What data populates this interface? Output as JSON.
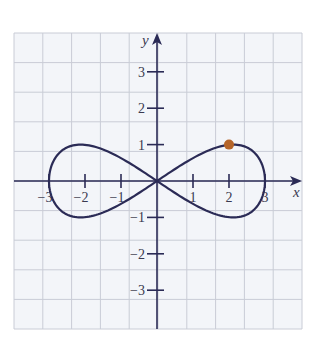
{
  "chart_data": {
    "type": "line",
    "title": "",
    "xlabel": "x",
    "ylabel": "y",
    "xlim": [
      -4.0,
      4.0
    ],
    "ylim": [
      -4.0,
      4.0
    ],
    "grid": true,
    "x_ticks": [
      -3,
      -2,
      -1,
      1,
      2,
      3
    ],
    "y_ticks": [
      3,
      2,
      1,
      -1,
      -2,
      -3
    ],
    "x_tick_labels": [
      "−3",
      "−2",
      "−1",
      "1",
      "2",
      "3"
    ],
    "y_tick_labels": [
      "3",
      "2",
      "1",
      "−1",
      "−2",
      "−3"
    ],
    "series": [
      {
        "name": "figure-eight curve",
        "parametric": "x = 3 cos t, y = sin 2t",
        "points": [
          [
            3.0,
            0.0
          ],
          [
            2.9,
            0.5
          ],
          [
            2.6,
            0.87
          ],
          [
            2.12,
            1.0
          ],
          [
            1.5,
            0.87
          ],
          [
            0.78,
            0.5
          ],
          [
            0.0,
            0.0
          ],
          [
            -0.78,
            -0.5
          ],
          [
            -1.5,
            -0.87
          ],
          [
            -2.12,
            -1.0
          ],
          [
            -2.6,
            -0.87
          ],
          [
            -2.9,
            -0.5
          ],
          [
            -3.0,
            0.0
          ],
          [
            -2.9,
            0.5
          ],
          [
            -2.6,
            0.87
          ],
          [
            -2.12,
            1.0
          ],
          [
            -1.5,
            0.87
          ],
          [
            -0.78,
            0.5
          ],
          [
            0.0,
            0.0
          ],
          [
            0.78,
            -0.5
          ],
          [
            1.5,
            -0.87
          ],
          [
            2.12,
            -1.0
          ],
          [
            2.6,
            -0.87
          ],
          [
            2.9,
            -0.5
          ],
          [
            3.0,
            0.0
          ]
        ],
        "color": "#2b2b56"
      }
    ],
    "highlighted_point": {
      "x": 2,
      "y": 1,
      "color": "#b5652a"
    },
    "legend": null
  },
  "colors": {
    "curve": "#2b2b56",
    "axes": "#2b2b56",
    "grid": "#c9ccd6",
    "grid_bg": "#f3f5f9",
    "dot": "#b5652a"
  }
}
